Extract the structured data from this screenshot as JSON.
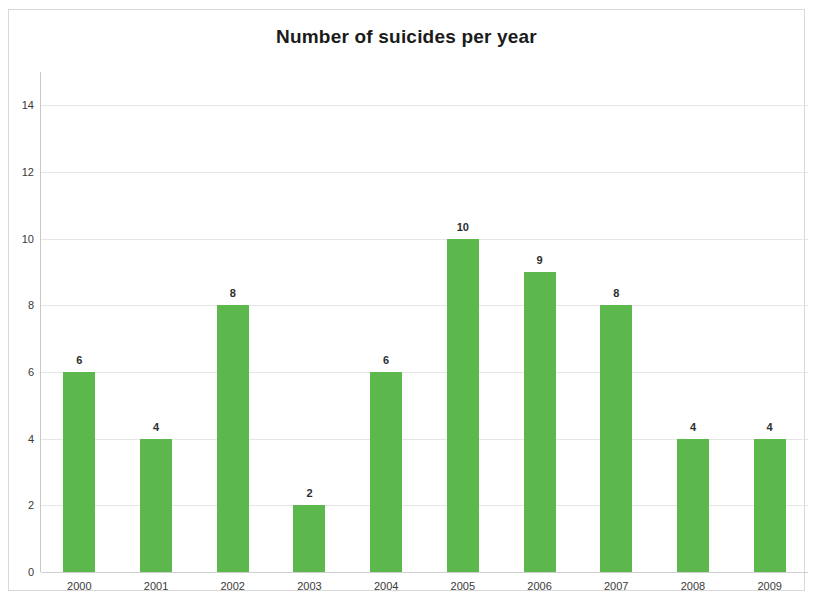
{
  "chart_data": {
    "type": "bar",
    "title": "Number of suicides per year",
    "xlabel": "",
    "ylabel": "",
    "categories": [
      "2000",
      "2001",
      "2002",
      "2003",
      "2004",
      "2005",
      "2006",
      "2007",
      "2008",
      "2009"
    ],
    "values": [
      6,
      4,
      8,
      2,
      6,
      10,
      9,
      8,
      4,
      4
    ],
    "value_labels": [
      "6",
      "4",
      "8",
      "2",
      "6",
      "10",
      "9",
      "8",
      "4",
      "4"
    ],
    "ylim": [
      0,
      15
    ],
    "y_ticks": [
      0,
      2,
      4,
      6,
      8,
      10,
      12,
      14
    ],
    "y_tick_labels": [
      "0",
      "2",
      "4",
      "6",
      "8",
      "10",
      "12",
      "14"
    ],
    "grid": true,
    "grid_axis": "y",
    "legend": false,
    "bar_color": "#5cb84c",
    "gridline_color": "#e6e6e6",
    "axis_color": "#c9c9c9",
    "text_color": "#3a3a3a",
    "background": "#ffffff"
  }
}
